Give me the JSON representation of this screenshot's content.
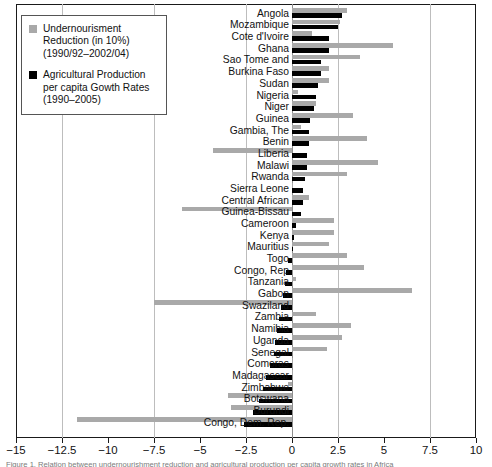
{
  "legend": {
    "items": [
      {
        "color": "#a9a9a9",
        "label": "Undernourisment Reduction (in 10%) (1990/92–2002/04)",
        "swatch_name": "legend-swatch-undernourishment"
      },
      {
        "color": "#000000",
        "label": "Agricultural Production per capita Gowth Rates (1990–2005)",
        "swatch_name": "legend-swatch-agriculture"
      }
    ]
  },
  "caption": {
    "text": "Figure 1. Relation between undernourishment reduction and agricultural production per capita growth rates in Africa"
  },
  "chart_data": {
    "type": "bar",
    "orientation": "horizontal",
    "title": "",
    "xlabel": "",
    "ylabel": "",
    "xlim": [
      -15,
      10
    ],
    "xticks": [
      "-15",
      "-12.5",
      "-10",
      "-7.5",
      "-5",
      "-2.5",
      "0",
      "2.5",
      "5",
      "7.5",
      "10"
    ],
    "xtick_values": [
      -15,
      -12.5,
      -10,
      -7.5,
      -5,
      -2.5,
      0,
      2.5,
      5,
      7.5,
      10
    ],
    "grid": true,
    "gridlines_at": [
      -12.5,
      -7.5,
      -2.5,
      2.5,
      7.5
    ],
    "legend_position": "top-left",
    "categories": [
      "Angola",
      "Mozambique",
      "Cote d'Ivoire",
      "Ghana",
      "Sao Tome and",
      "Burkina Faso",
      "Sudan",
      "Nigeria",
      "Niger",
      "Guinea",
      "Gambia, The",
      "Benin",
      "Liberia",
      "Malawi",
      "Rwanda",
      "Sierra Leone",
      "Central African",
      "Guinea-Bissau",
      "Cameroon",
      "Kenya",
      "Mauritius",
      "Togo",
      "Congo, Rep",
      "Tanzania",
      "Gabon",
      "Swaziland",
      "Zambia",
      "Namibia",
      "Uganda",
      "Senegal",
      "Comoras",
      "Madagascar",
      "Zimbabwe",
      "Botswana",
      "Burundi",
      "Congo, Dem. Rep."
    ],
    "series": [
      {
        "name": "Undernourisment Reduction (in 10%) (1990/92-2002/04)",
        "color": "#a9a9a9",
        "values": [
          3.0,
          2.6,
          1.1,
          5.5,
          3.7,
          2.0,
          2.0,
          0.3,
          1.3,
          3.3,
          0.5,
          4.1,
          -4.3,
          4.7,
          3.0,
          0.0,
          0.9,
          -6.0,
          2.3,
          2.3,
          2.0,
          3.0,
          3.9,
          0.2,
          6.5,
          -7.5,
          1.3,
          3.2,
          2.7,
          1.9,
          0.0,
          0.0,
          -0.2,
          -3.5,
          -3.3,
          -11.7
        ]
      },
      {
        "name": "Agricultural Production per capita Gowth Rates (1990-2005)",
        "color": "#000000",
        "values": [
          2.7,
          2.5,
          2.0,
          2.0,
          1.6,
          1.6,
          1.4,
          1.3,
          1.2,
          1.0,
          0.9,
          0.9,
          0.8,
          0.8,
          0.7,
          0.6,
          0.6,
          0.5,
          0.2,
          0.1,
          0.0,
          -0.2,
          -0.3,
          -0.4,
          -0.5,
          -0.6,
          -0.7,
          -0.8,
          -0.9,
          -1.0,
          -1.2,
          -1.4,
          -1.6,
          -1.8,
          -2.1,
          -2.6
        ]
      }
    ]
  }
}
